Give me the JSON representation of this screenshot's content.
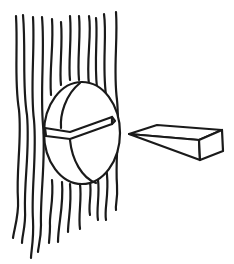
{
  "illustration": {
    "description": "Line drawing of wavy vertical strands with an oval disc containing a wedge-shaped slot, and a separate wedge block to the right",
    "ink_color": "#1a1a1a",
    "background_color": "#ffffff",
    "strands": {
      "count": 12,
      "top_y_range": [
        14,
        22
      ],
      "bottom_y_range": [
        215,
        258
      ]
    },
    "disc": {
      "shape": "oval",
      "has_slot": true
    },
    "wedge_block": {
      "shape": "wedge",
      "position": "right-of-disc"
    }
  }
}
